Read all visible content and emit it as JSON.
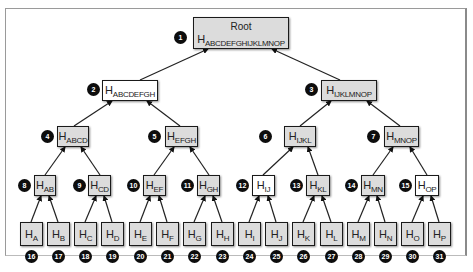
{
  "diagram": {
    "type": "merkle-tree",
    "colors": {
      "gray_fill": "#dcdcdc",
      "white_fill": "#ffffff",
      "border": "#1a1a1a",
      "badge": "#0d0d0d"
    },
    "root": {
      "badge": "1",
      "title": "Root",
      "hash_prefix": "H",
      "hash_sub": "ABCDEFGHIJKLMNOP",
      "fill": "gray"
    },
    "nodes": [
      {
        "id": "n2",
        "badge": "2",
        "hash_prefix": "H",
        "hash_sub": "ABCDEFGH",
        "fill": "white"
      },
      {
        "id": "n3",
        "badge": "3",
        "hash_prefix": "H",
        "hash_sub": "IJKLMNOP",
        "fill": "gray"
      },
      {
        "id": "n4",
        "badge": "4",
        "hash_prefix": "H",
        "hash_sub": "ABCD",
        "fill": "gray"
      },
      {
        "id": "n5",
        "badge": "5",
        "hash_prefix": "H",
        "hash_sub": "EFGH",
        "fill": "gray"
      },
      {
        "id": "n6",
        "badge": "6",
        "hash_prefix": "H",
        "hash_sub": "IJKL",
        "fill": "gray"
      },
      {
        "id": "n7",
        "badge": "7",
        "hash_prefix": "H",
        "hash_sub": "MNOP",
        "fill": "gray"
      },
      {
        "id": "n8",
        "badge": "8",
        "hash_prefix": "H",
        "hash_sub": "AB",
        "fill": "gray"
      },
      {
        "id": "n9",
        "badge": "9",
        "hash_prefix": "H",
        "hash_sub": "CD",
        "fill": "gray"
      },
      {
        "id": "n10",
        "badge": "10",
        "hash_prefix": "H",
        "hash_sub": "EF",
        "fill": "gray"
      },
      {
        "id": "n11",
        "badge": "11",
        "hash_prefix": "H",
        "hash_sub": "GH",
        "fill": "gray"
      },
      {
        "id": "n12",
        "badge": "12",
        "hash_prefix": "H",
        "hash_sub": "IJ",
        "fill": "white"
      },
      {
        "id": "n13",
        "badge": "13",
        "hash_prefix": "H",
        "hash_sub": "KL",
        "fill": "gray"
      },
      {
        "id": "n14",
        "badge": "14",
        "hash_prefix": "H",
        "hash_sub": "MN",
        "fill": "gray"
      },
      {
        "id": "n15",
        "badge": "15",
        "hash_prefix": "H",
        "hash_sub": "OP",
        "fill": "white"
      }
    ],
    "leaves": [
      {
        "badge": "16",
        "hash_prefix": "H",
        "hash_sub": "A"
      },
      {
        "badge": "17",
        "hash_prefix": "H",
        "hash_sub": "B"
      },
      {
        "badge": "18",
        "hash_prefix": "H",
        "hash_sub": "C"
      },
      {
        "badge": "19",
        "hash_prefix": "H",
        "hash_sub": "D"
      },
      {
        "badge": "20",
        "hash_prefix": "H",
        "hash_sub": "E"
      },
      {
        "badge": "21",
        "hash_prefix": "H",
        "hash_sub": "F"
      },
      {
        "badge": "22",
        "hash_prefix": "H",
        "hash_sub": "G"
      },
      {
        "badge": "23",
        "hash_prefix": "H",
        "hash_sub": "H"
      },
      {
        "badge": "24",
        "hash_prefix": "H",
        "hash_sub": "I"
      },
      {
        "badge": "25",
        "hash_prefix": "H",
        "hash_sub": "J"
      },
      {
        "badge": "26",
        "hash_prefix": "H",
        "hash_sub": "K"
      },
      {
        "badge": "27",
        "hash_prefix": "H",
        "hash_sub": "L"
      },
      {
        "badge": "28",
        "hash_prefix": "H",
        "hash_sub": "M"
      },
      {
        "badge": "29",
        "hash_prefix": "H",
        "hash_sub": "N"
      },
      {
        "badge": "30",
        "hash_prefix": "H",
        "hash_sub": "O"
      },
      {
        "badge": "31",
        "hash_prefix": "H",
        "hash_sub": "P"
      }
    ]
  }
}
